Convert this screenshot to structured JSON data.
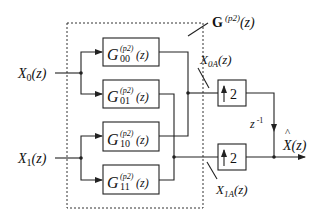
{
  "diagram": {
    "inputs": [
      {
        "label": "X",
        "sub": "0",
        "arg": "(z)"
      },
      {
        "label": "X",
        "sub": "1",
        "arg": "(z)"
      }
    ],
    "matrix_label": {
      "name": "G",
      "sup": "(p2)",
      "arg": "(z)"
    },
    "filters": [
      {
        "name": "G",
        "sup": "(p2)",
        "sub": "00",
        "arg": "(z)"
      },
      {
        "name": "G",
        "sup": "(p2)",
        "sub": "01",
        "arg": "(z)"
      },
      {
        "name": "G",
        "sup": "(p2)",
        "sub": "10",
        "arg": "(z)"
      },
      {
        "name": "G",
        "sup": "(p2)",
        "sub": "11",
        "arg": "(z)"
      }
    ],
    "upsamplers": [
      {
        "factor": "2"
      },
      {
        "factor": "2"
      }
    ],
    "intermediate": [
      {
        "label": "X",
        "sub": "0A",
        "arg": "(z)"
      },
      {
        "label": "X",
        "sub": "1A",
        "arg": "(z)"
      }
    ],
    "delay": {
      "label": "z",
      "sup": "-1"
    },
    "output": {
      "hat": "^",
      "label": "X",
      "arg": "(z)"
    }
  }
}
